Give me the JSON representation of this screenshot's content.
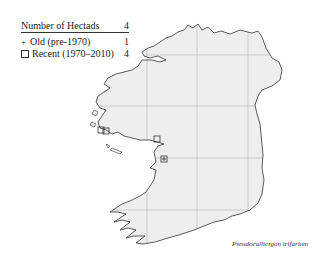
{
  "legend": {
    "header_label": "Number of Hectads",
    "header_value": "4",
    "rows": [
      {
        "symbol": "+",
        "symbol_name": "plus",
        "label": "Old  (pre-1970)",
        "value": "1"
      },
      {
        "symbol": "□",
        "symbol_name": "square",
        "label": "Recent  (1970–2010)",
        "value": "4"
      }
    ]
  },
  "map": {
    "region": "Ireland",
    "land_color": "#eeeeee",
    "coast_color": "#333333",
    "grid_color": "#bbbbbb",
    "grid_x": [
      97,
      147,
      197,
      248
    ],
    "grid_y": [
      55,
      106,
      158,
      210
    ],
    "records": [
      {
        "type": "recent",
        "x": 101,
        "y": 130
      },
      {
        "type": "recent",
        "x": 106,
        "y": 131
      },
      {
        "type": "recent",
        "x": 157,
        "y": 139
      },
      {
        "type": "recent",
        "x": 164,
        "y": 159
      },
      {
        "type": "old",
        "x": 164,
        "y": 159
      }
    ]
  },
  "species_label": "Pseudocalliergon trifarium"
}
